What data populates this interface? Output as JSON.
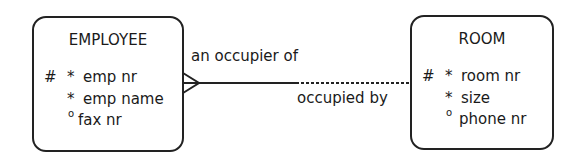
{
  "entities": [
    {
      "name": "EMPLOYEE",
      "attributes": [
        {
          "uid": "#",
          "opt": "*",
          "name": "emp nr"
        },
        {
          "uid": "",
          "opt": "*",
          "name": "emp name"
        },
        {
          "uid": "",
          "opt": "o",
          "name": "fax nr"
        }
      ]
    },
    {
      "name": "ROOM",
      "attributes": [
        {
          "uid": "#",
          "opt": "*",
          "name": "room nr"
        },
        {
          "uid": "",
          "opt": "*",
          "name": "size"
        },
        {
          "uid": "",
          "opt": "o",
          "name": "phone nr"
        }
      ]
    }
  ],
  "relationship": {
    "from_label": "an occupier of",
    "to_label": "occupied by",
    "from_cardinality": "many (crow's foot), mandatory",
    "to_cardinality": "one, optional"
  }
}
